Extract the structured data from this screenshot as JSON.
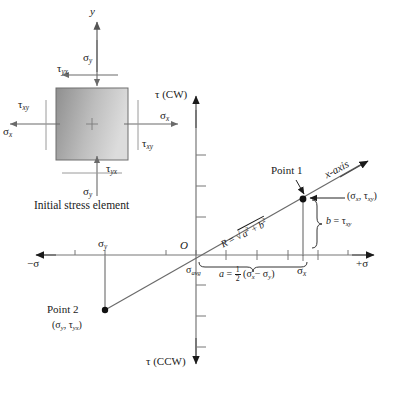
{
  "figure": {
    "title_caption": "Initial stress element",
    "stress_element": {
      "axis_y_label": "y",
      "sigma_y_top": "σ",
      "sigma_y_top_sub": "y",
      "sigma_y_bottom": "σ",
      "sigma_y_bottom_sub": "y",
      "sigma_x_left": "σ",
      "sigma_x_left_sub": "x",
      "sigma_x_right": "σ",
      "sigma_x_right_sub": "x",
      "tau_yx_top": "τ",
      "tau_yx_top_sub": "yx",
      "tau_yx_bottom": "τ",
      "tau_yx_bottom_sub": "yx",
      "tau_xy_left": "τ",
      "tau_xy_left_sub": "xy",
      "tau_xy_right": "τ",
      "tau_xy_right_sub": "xy"
    },
    "mohr": {
      "axis_tau_cw": "τ (CW)",
      "axis_tau_ccw": "τ (CCW)",
      "axis_sigma_neg": "−σ",
      "axis_sigma_pos": "+σ",
      "origin_label": "O",
      "point1_label": "Point 1",
      "point1_coords_open": "(σ",
      "point1_coords_sub1": "x",
      "point1_coords_mid": ", τ",
      "point1_coords_sub2": "xy",
      "point1_coords_close": ")",
      "point2_label": "Point 2",
      "point2_coords_open": "(σ",
      "point2_coords_sub1": "y",
      "point2_coords_mid": ", τ",
      "point2_coords_sub2": "yx",
      "point2_coords_close": ")",
      "x_axis_label": "x-axis",
      "sigma_avg": "σ",
      "sigma_avg_sub": "avg",
      "sigma_x_tick": "σ",
      "sigma_x_tick_sub": "x",
      "sigma_y_tick": "σ",
      "sigma_y_tick_sub": "y",
      "radius_formula_R": "R",
      "radius_formula_eq": "=",
      "radius_formula_a": "a",
      "radius_formula_plus": "+",
      "radius_formula_b": "b",
      "radius_exp": "2",
      "a_formula_a": "a",
      "a_formula_eq": "=",
      "a_formula_num": "1",
      "a_formula_den": "2",
      "a_formula_open": "(σ",
      "a_formula_sub1": "x",
      "a_formula_minus": "− σ",
      "a_formula_sub2": "y",
      "a_formula_close": ")",
      "b_formula_b": "b",
      "b_formula_eq": "= τ",
      "b_formula_sub": "xy"
    },
    "colors": {
      "line": "#1a1a1a",
      "axis": "#5a5a5a",
      "stroke_gray": "#8a8a8a",
      "element_fill_dark": "#9a9a9a",
      "element_fill_light": "#d8d8d8",
      "background": "#ffffff"
    }
  }
}
